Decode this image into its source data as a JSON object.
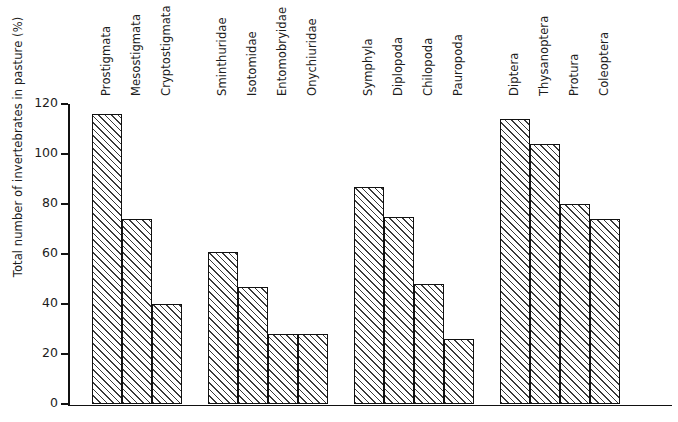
{
  "chart_data": {
    "type": "bar",
    "title": "",
    "xlabel": "",
    "ylabel": "Total number of invertebrates in pasture (%)",
    "ylim": [
      0,
      120
    ],
    "yticks": [
      0,
      20,
      40,
      60,
      80,
      100,
      120
    ],
    "grid": false,
    "legend": "none",
    "orientation": "vertical",
    "bar_fill": "diagonal-hatch",
    "groups": [
      {
        "name": "Acari",
        "categories": [
          "Prostigmata",
          "Mesostigmata",
          "Cryptostigmata"
        ],
        "values": [
          116,
          74,
          40
        ]
      },
      {
        "name": "Collembola",
        "categories": [
          "Sminthuridae",
          "Isotomidae",
          "Entomobryidae",
          "Onychiuridae"
        ],
        "values": [
          61,
          47,
          28,
          28
        ]
      },
      {
        "name": "Myriapoda",
        "categories": [
          "Symphyla",
          "Diplopoda",
          "Chilopoda",
          "Pauropoda"
        ],
        "values": [
          87,
          75,
          48,
          26
        ]
      },
      {
        "name": "Insecta",
        "categories": [
          "Diptera",
          "Thysanoptera",
          "Protura",
          "Coleoptera"
        ],
        "values": [
          114,
          104,
          80,
          74
        ]
      }
    ],
    "categories": [
      "Prostigmata",
      "Mesostigmata",
      "Cryptostigmata",
      "Sminthuridae",
      "Isotomidae",
      "Entomobryidae",
      "Onychiuridae",
      "Symphyla",
      "Diplopoda",
      "Chilopoda",
      "Pauropoda",
      "Diptera",
      "Thysanoptera",
      "Protura",
      "Coleoptera"
    ],
    "values": [
      116,
      74,
      40,
      61,
      47,
      28,
      28,
      87,
      75,
      48,
      26,
      114,
      104,
      80,
      74
    ],
    "colors": {
      "axis": "#111111",
      "bar_outline": "#111111",
      "bar_hatch": "#3a3a3a",
      "bar_background": "#ffffff",
      "text": "#1c1c1c",
      "page_background": "#ffffff"
    }
  },
  "axis": {
    "y_title": "Total number of invertebrates in pasture (%)",
    "tick_labels": [
      "120",
      "100",
      "80",
      "60",
      "40",
      "20",
      "0"
    ]
  }
}
